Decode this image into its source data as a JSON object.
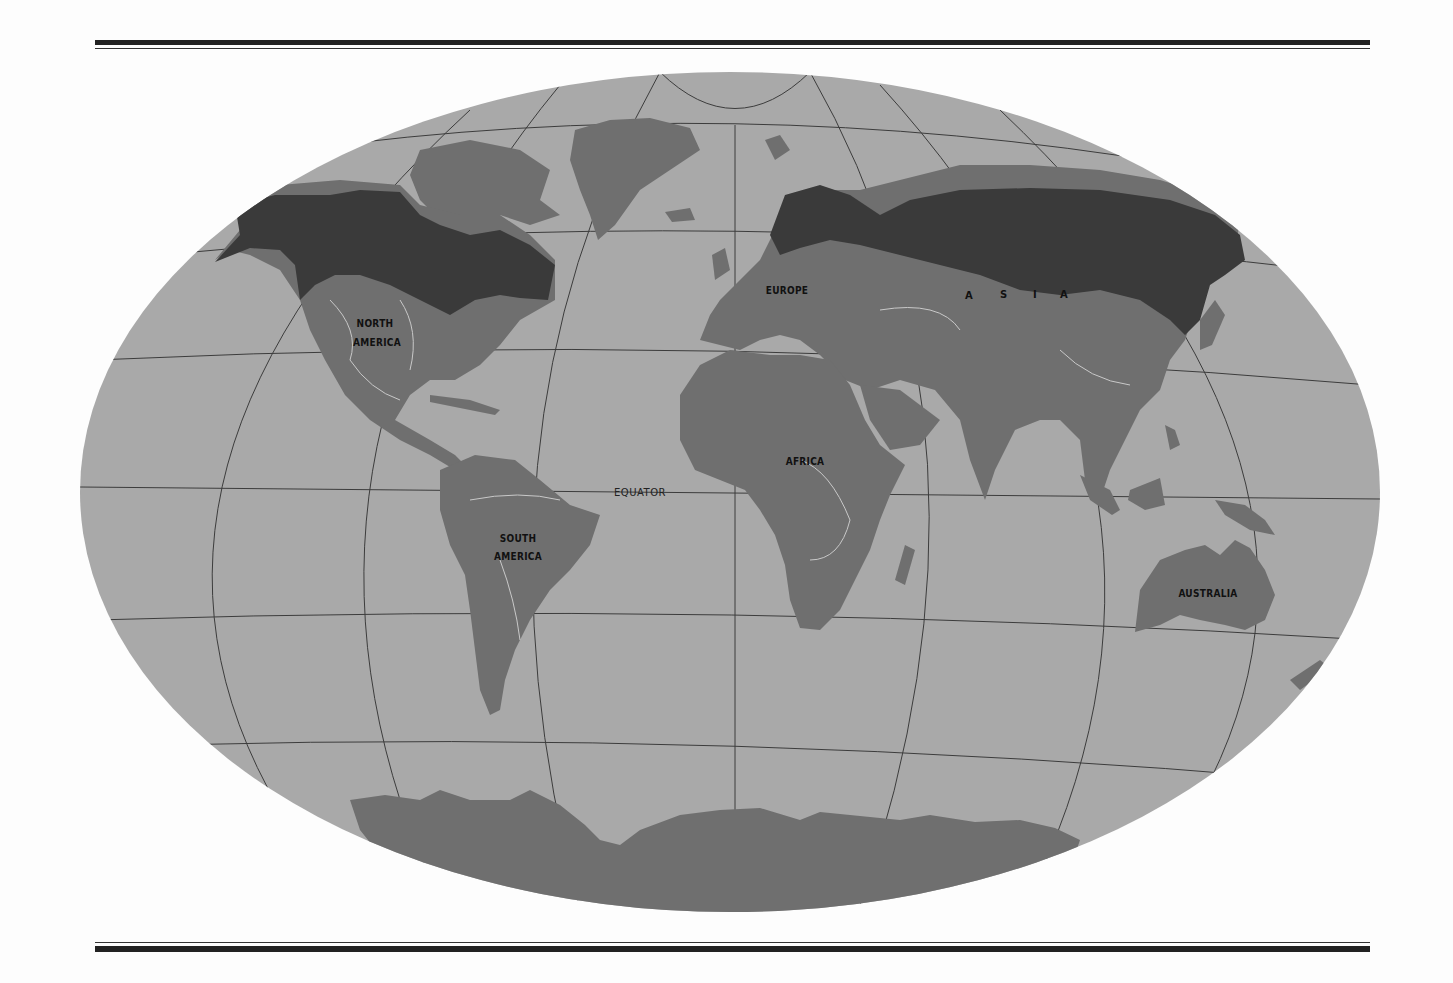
{
  "map": {
    "projection": "oval world map (Hammer/Aitoff-style)",
    "colors": {
      "ocean": "#a9a9a9",
      "land": "#6f6f6f",
      "highlight_region": "#3a3a3a",
      "graticule": "#3c3c3c",
      "rivers": "#c9c9c9",
      "page": "#fdfdfd",
      "rules": "#222222"
    },
    "labels": {
      "north_america_line1": "NORTH",
      "north_america_line2": "AMERICA",
      "south_america_line1": "SOUTH",
      "south_america_line2": "AMERICA",
      "europe": "EUROPE",
      "asia_letters": [
        "A",
        "S",
        "I",
        "A"
      ],
      "africa": "AFRICA",
      "australia": "AUSTRALIA",
      "equator": "EQUATOR"
    },
    "highlighted_regions": [
      "northern North America (boreal belt)",
      "northern Eurasia (boreal belt)"
    ]
  }
}
